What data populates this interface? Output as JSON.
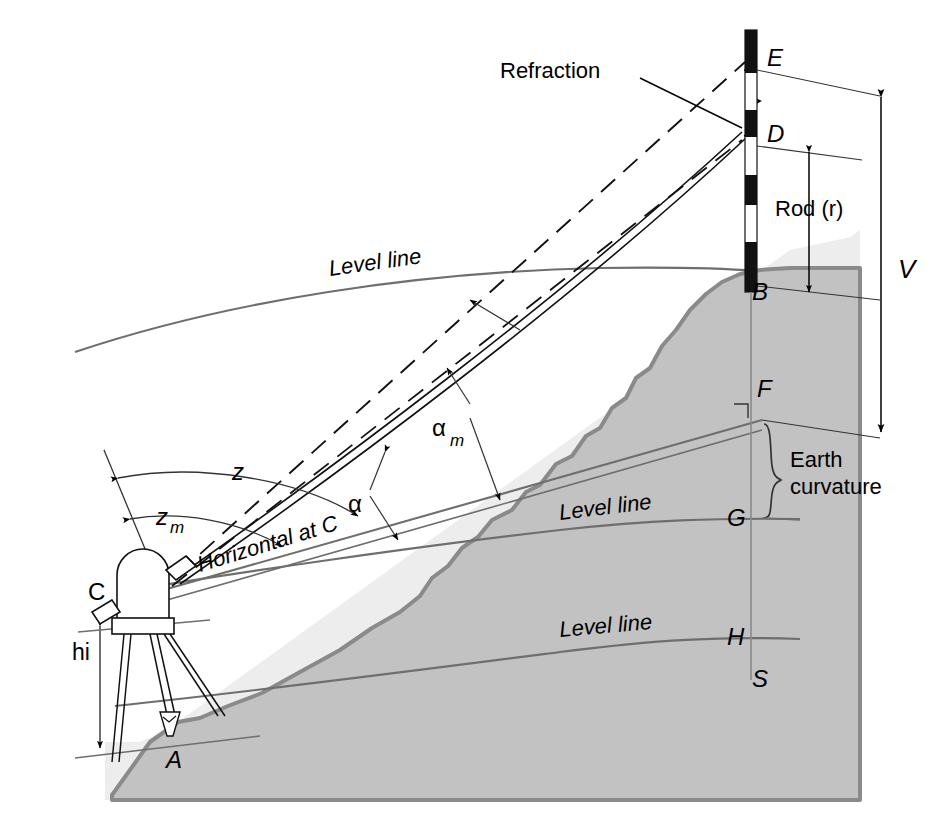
{
  "figure": {
    "domain": "diagram"
  },
  "colors": {
    "background": "#ffffff",
    "sky_panel": "#ededed",
    "terrain_fill": "#c8c8c8",
    "terrain_edge": "#8c8c8c",
    "line": "#000000",
    "level_line": "#6e6e6e",
    "rod_dark": "#111111",
    "rod_light": "#ffffff"
  },
  "points": {
    "A": {
      "label": "A",
      "x": 175,
      "y": 757,
      "desc": "ground station under instrument"
    },
    "B": {
      "label": "B",
      "x": 757,
      "y": 292,
      "desc": "rod base at hilltop"
    },
    "C": {
      "label": "C",
      "x": 120,
      "y": 594,
      "desc": "instrument center"
    },
    "D": {
      "label": "D",
      "x": 771,
      "y": 135,
      "desc": "rod reading, refracted sight"
    },
    "E": {
      "label": "E",
      "x": 771,
      "y": 59,
      "desc": "rod reading, straight sight"
    },
    "F": {
      "label": "F",
      "x": 762,
      "y": 389,
      "desc": "horizontal at C, vertical on rod"
    },
    "G": {
      "label": "G",
      "x": 762,
      "y": 518,
      "desc": "level line through C"
    },
    "H": {
      "label": "H",
      "x": 762,
      "y": 637,
      "desc": "level line lower"
    },
    "S": {
      "label": "S",
      "x": 762,
      "y": 679,
      "desc": "lower level line terminus"
    }
  },
  "labels": {
    "refraction": "Refraction",
    "rod": "Rod (r)",
    "vertical_distance": "V",
    "earth_curvature_line1": "Earth",
    "earth_curvature_line2": "curvature",
    "level_line_top": "Level line",
    "level_line_mid": "Level line",
    "level_line_low": "Level line",
    "horizontal_at_c": "Horizontal at C",
    "height_of_instrument": "hi",
    "zenith_angle": "z",
    "zenith_angle_sub": "m",
    "zenith_angle_measured": "z",
    "vertical_angle": "α",
    "vertical_angle_measured": "α",
    "vertical_angle_sub": "m"
  },
  "angles": [
    {
      "name": "z",
      "symbol": "z",
      "subscript": "",
      "desc": "true zenith angle from vertical at C to line C-E"
    },
    {
      "name": "z_m",
      "symbol": "z",
      "subscript": "m",
      "desc": "measured zenith angle from vertical at C to line C-D"
    },
    {
      "name": "alpha",
      "symbol": "α",
      "subscript": "",
      "desc": "true vertical angle above horizontal"
    },
    {
      "name": "alpha_m",
      "symbol": "α",
      "subscript": "m",
      "desc": "measured vertical angle above horizontal"
    }
  ],
  "dimensions": [
    {
      "name": "V",
      "label": "V",
      "desc": "vertical distance from horizontal at C to point E"
    },
    {
      "name": "r",
      "label": "Rod (r)",
      "desc": "rod reading from B up to D"
    },
    {
      "name": "hi",
      "label": "hi",
      "desc": "height of instrument above point A"
    },
    {
      "name": "earth_curvature",
      "label": "Earth curvature",
      "desc": "separation between horizontal line at F and level line at G"
    }
  ],
  "rod": {
    "x": 745,
    "top": 30,
    "bottom": 292,
    "width": 12,
    "segments": [
      {
        "from": 30,
        "to": 73,
        "color": "dark"
      },
      {
        "from": 73,
        "to": 110,
        "color": "light"
      },
      {
        "from": 110,
        "to": 137,
        "color": "dark"
      },
      {
        "from": 137,
        "to": 175,
        "color": "light"
      },
      {
        "from": 175,
        "to": 205,
        "color": "dark"
      },
      {
        "from": 205,
        "to": 242,
        "color": "light"
      },
      {
        "from": 242,
        "to": 292,
        "color": "dark"
      }
    ]
  }
}
